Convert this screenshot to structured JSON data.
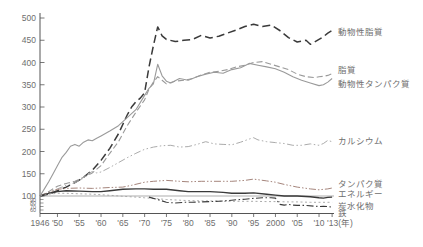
{
  "chart_data": {
    "type": "line",
    "title": "",
    "subtitle": "",
    "x_axis": {
      "unit_label": "(年)",
      "range": [
        1946,
        2015
      ],
      "tick_years": [
        1946,
        1950,
        1955,
        1960,
        1965,
        1970,
        1975,
        1980,
        1985,
        1990,
        1995,
        2000,
        2005,
        2010,
        2013
      ],
      "tick_labels": [
        "1946",
        "'50",
        "'55",
        "'60",
        "'65",
        "'70",
        "'75",
        "'80",
        "'85",
        "'90",
        "'95",
        "2000",
        "'05",
        "'10",
        "'13(年)"
      ]
    },
    "y_axis": {
      "range_main": [
        100,
        500
      ],
      "tick_values": [
        500,
        450,
        400,
        350,
        300,
        250,
        200,
        150,
        100
      ],
      "tick_labels": [
        "500",
        "450",
        "400",
        "350",
        "300",
        "250",
        "200",
        "150",
        "100"
      ],
      "sub_tick_values": [
        90,
        80,
        70,
        60
      ],
      "sub_tick_labels": [
        "90",
        "80",
        "70",
        "60"
      ],
      "baseline_value": 100,
      "grid": false
    },
    "legend_position": "right-margin-labels",
    "colors": {
      "dark": "#3a3a3a",
      "gray": "#9a9a9a",
      "light_gray": "#ababab",
      "red_gray": "#a5857c",
      "axis": "#555555",
      "label_text": "#6e6e6e"
    },
    "series": [
      {
        "key": "animal-fat",
        "name": "動物性脂質",
        "color": "#3a3a3a",
        "dash": "8,4",
        "width": 1.5,
        "label_value": 468,
        "points": [
          [
            1946,
            100
          ],
          [
            1948,
            104
          ],
          [
            1950,
            112
          ],
          [
            1952,
            120
          ],
          [
            1954,
            130
          ],
          [
            1956,
            142
          ],
          [
            1958,
            158
          ],
          [
            1960,
            180
          ],
          [
            1962,
            207
          ],
          [
            1964,
            240
          ],
          [
            1966,
            282
          ],
          [
            1967,
            300
          ],
          [
            1968,
            312
          ],
          [
            1969,
            320
          ],
          [
            1970,
            332
          ],
          [
            1971,
            390
          ],
          [
            1972,
            438
          ],
          [
            1973,
            480
          ],
          [
            1974,
            460
          ],
          [
            1975,
            452
          ],
          [
            1977,
            447
          ],
          [
            1979,
            450
          ],
          [
            1981,
            452
          ],
          [
            1983,
            461
          ],
          [
            1985,
            455
          ],
          [
            1987,
            459
          ],
          [
            1989,
            466
          ],
          [
            1991,
            473
          ],
          [
            1993,
            481
          ],
          [
            1995,
            486
          ],
          [
            1997,
            481
          ],
          [
            1999,
            484
          ],
          [
            2001,
            472
          ],
          [
            2003,
            456
          ],
          [
            2005,
            446
          ],
          [
            2007,
            450
          ],
          [
            2008,
            441
          ],
          [
            2009,
            446
          ],
          [
            2010,
            452
          ],
          [
            2011,
            458
          ],
          [
            2012,
            466
          ],
          [
            2013,
            472
          ]
        ]
      },
      {
        "key": "fat",
        "name": "脂質",
        "color": "#9a9a9a",
        "dash": "6,3",
        "width": 1.1,
        "label_value": 383,
        "points": [
          [
            1946,
            100
          ],
          [
            1948,
            110
          ],
          [
            1950,
            122
          ],
          [
            1952,
            128
          ],
          [
            1954,
            133
          ],
          [
            1956,
            142
          ],
          [
            1958,
            152
          ],
          [
            1960,
            168
          ],
          [
            1962,
            196
          ],
          [
            1964,
            222
          ],
          [
            1966,
            258
          ],
          [
            1968,
            288
          ],
          [
            1970,
            316
          ],
          [
            1971,
            340
          ],
          [
            1972,
            356
          ],
          [
            1973,
            368
          ],
          [
            1974,
            360
          ],
          [
            1975,
            352
          ],
          [
            1977,
            358
          ],
          [
            1979,
            360
          ],
          [
            1981,
            364
          ],
          [
            1983,
            372
          ],
          [
            1985,
            378
          ],
          [
            1987,
            380
          ],
          [
            1989,
            384
          ],
          [
            1991,
            390
          ],
          [
            1993,
            394
          ],
          [
            1995,
            400
          ],
          [
            1997,
            402
          ],
          [
            1999,
            396
          ],
          [
            2001,
            390
          ],
          [
            2003,
            384
          ],
          [
            2005,
            374
          ],
          [
            2007,
            368
          ],
          [
            2009,
            366
          ],
          [
            2010,
            368
          ],
          [
            2011,
            369
          ],
          [
            2012,
            371
          ],
          [
            2013,
            375
          ]
        ]
      },
      {
        "key": "animal-protein",
        "name": "動物性タンパク質",
        "color": "#9a9a9a",
        "dash": "",
        "width": 1.1,
        "label_value": 352,
        "points": [
          [
            1946,
            100
          ],
          [
            1947,
            116
          ],
          [
            1948,
            132
          ],
          [
            1949,
            150
          ],
          [
            1950,
            168
          ],
          [
            1951,
            186
          ],
          [
            1952,
            198
          ],
          [
            1953,
            212
          ],
          [
            1954,
            216
          ],
          [
            1955,
            212
          ],
          [
            1956,
            221
          ],
          [
            1957,
            226
          ],
          [
            1958,
            224
          ],
          [
            1959,
            230
          ],
          [
            1960,
            235
          ],
          [
            1962,
            246
          ],
          [
            1964,
            258
          ],
          [
            1966,
            276
          ],
          [
            1968,
            294
          ],
          [
            1970,
            326
          ],
          [
            1971,
            342
          ],
          [
            1972,
            352
          ],
          [
            1973,
            396
          ],
          [
            1974,
            370
          ],
          [
            1975,
            358
          ],
          [
            1976,
            354
          ],
          [
            1978,
            364
          ],
          [
            1980,
            360
          ],
          [
            1982,
            368
          ],
          [
            1984,
            374
          ],
          [
            1986,
            378
          ],
          [
            1988,
            376
          ],
          [
            1990,
            384
          ],
          [
            1992,
            388
          ],
          [
            1994,
            398
          ],
          [
            1996,
            394
          ],
          [
            1998,
            390
          ],
          [
            2000,
            386
          ],
          [
            2002,
            378
          ],
          [
            2004,
            368
          ],
          [
            2006,
            360
          ],
          [
            2008,
            354
          ],
          [
            2010,
            348
          ],
          [
            2011,
            350
          ],
          [
            2012,
            356
          ],
          [
            2013,
            364
          ]
        ]
      },
      {
        "key": "calcium",
        "name": "カルシウム",
        "color": "#ababab",
        "dash": "7,2.5,1.5,2.5,1.5,2.5",
        "width": 1.0,
        "label_value": 224,
        "points": [
          [
            1946,
            100
          ],
          [
            1948,
            108
          ],
          [
            1950,
            116
          ],
          [
            1952,
            124
          ],
          [
            1954,
            130
          ],
          [
            1956,
            140
          ],
          [
            1957,
            150
          ],
          [
            1958,
            155
          ],
          [
            1959,
            152
          ],
          [
            1960,
            154
          ],
          [
            1962,
            164
          ],
          [
            1964,
            175
          ],
          [
            1966,
            186
          ],
          [
            1968,
            196
          ],
          [
            1970,
            205
          ],
          [
            1972,
            210
          ],
          [
            1974,
            213
          ],
          [
            1976,
            214
          ],
          [
            1978,
            210
          ],
          [
            1980,
            211
          ],
          [
            1982,
            216
          ],
          [
            1984,
            222
          ],
          [
            1986,
            217
          ],
          [
            1988,
            216
          ],
          [
            1990,
            215
          ],
          [
            1992,
            221
          ],
          [
            1994,
            228
          ],
          [
            1995,
            231
          ],
          [
            1996,
            226
          ],
          [
            1998,
            222
          ],
          [
            2000,
            220
          ],
          [
            2002,
            218
          ],
          [
            2004,
            214
          ],
          [
            2006,
            214
          ],
          [
            2008,
            217
          ],
          [
            2010,
            214
          ],
          [
            2011,
            218
          ],
          [
            2012,
            225
          ],
          [
            2013,
            222
          ]
        ]
      },
      {
        "key": "protein",
        "name": "タンパク質",
        "color": "#a5857c",
        "dash": "7,2,1.5,2,1.5,2",
        "width": 1.0,
        "label_value": 127,
        "points": [
          [
            1946,
            100
          ],
          [
            1948,
            108
          ],
          [
            1950,
            115
          ],
          [
            1952,
            117
          ],
          [
            1955,
            118
          ],
          [
            1958,
            117
          ],
          [
            1960,
            118
          ],
          [
            1962,
            119
          ],
          [
            1965,
            120
          ],
          [
            1967,
            124
          ],
          [
            1970,
            131
          ],
          [
            1972,
            133
          ],
          [
            1975,
            135
          ],
          [
            1978,
            133
          ],
          [
            1980,
            132
          ],
          [
            1983,
            133
          ],
          [
            1985,
            133
          ],
          [
            1988,
            133
          ],
          [
            1990,
            133
          ],
          [
            1993,
            135
          ],
          [
            1995,
            138
          ],
          [
            1998,
            134
          ],
          [
            2000,
            131
          ],
          [
            2002,
            126
          ],
          [
            2005,
            120
          ],
          [
            2008,
            116
          ],
          [
            2010,
            114
          ],
          [
            2012,
            116
          ],
          [
            2013,
            118
          ]
        ]
      },
      {
        "key": "energy",
        "name": "エネルギー",
        "color": "#3a3a3a",
        "dash": "",
        "width": 1.4,
        "label_value": 104,
        "points": [
          [
            1946,
            100
          ],
          [
            1948,
            106
          ],
          [
            1950,
            110
          ],
          [
            1952,
            112
          ],
          [
            1955,
            111
          ],
          [
            1958,
            110
          ],
          [
            1960,
            110
          ],
          [
            1962,
            112
          ],
          [
            1965,
            115
          ],
          [
            1968,
            116
          ],
          [
            1970,
            116
          ],
          [
            1972,
            115
          ],
          [
            1975,
            115
          ],
          [
            1978,
            112
          ],
          [
            1980,
            110
          ],
          [
            1983,
            110
          ],
          [
            1985,
            110
          ],
          [
            1988,
            108
          ],
          [
            1990,
            106
          ],
          [
            1993,
            106
          ],
          [
            1995,
            107
          ],
          [
            1998,
            104
          ],
          [
            2000,
            102
          ],
          [
            2002,
            100
          ],
          [
            2005,
            100
          ],
          [
            2008,
            98
          ],
          [
            2010,
            95
          ],
          [
            2011,
            94
          ],
          [
            2012,
            96
          ],
          [
            2013,
            97
          ]
        ]
      },
      {
        "key": "carbohydrate",
        "name": "炭水化物",
        "color": "#ababab",
        "dash": "2,2.5",
        "width": 1.0,
        "label_value": 72,
        "points": [
          [
            1946,
            100
          ],
          [
            1948,
            104
          ],
          [
            1950,
            106
          ],
          [
            1952,
            106
          ],
          [
            1955,
            105
          ],
          [
            1958,
            104
          ],
          [
            1960,
            103
          ],
          [
            1963,
            101
          ],
          [
            1965,
            99
          ],
          [
            1968,
            97
          ],
          [
            1970,
            95
          ],
          [
            1972,
            93
          ],
          [
            1975,
            90
          ],
          [
            1978,
            88
          ],
          [
            1980,
            87
          ],
          [
            1983,
            86
          ],
          [
            1985,
            86
          ],
          [
            1988,
            85
          ],
          [
            1990,
            85
          ],
          [
            1993,
            85
          ],
          [
            1995,
            85
          ],
          [
            1998,
            84
          ],
          [
            2000,
            84
          ],
          [
            2003,
            83
          ],
          [
            2005,
            83
          ],
          [
            2008,
            82
          ],
          [
            2010,
            82
          ],
          [
            2013,
            82
          ]
        ]
      },
      {
        "key": "iron",
        "name": "鉄",
        "color": "#3a3a3a",
        "dash": "7,2.5,1.5,2.5",
        "width": 1.1,
        "label_value": 52,
        "points": [
          [
            1971,
            97
          ],
          [
            1972,
            93
          ],
          [
            1973,
            90
          ],
          [
            1975,
            82
          ],
          [
            1977,
            80
          ],
          [
            1979,
            82
          ],
          [
            1981,
            82
          ],
          [
            1983,
            83
          ],
          [
            1985,
            84
          ],
          [
            1987,
            85
          ],
          [
            1989,
            87
          ],
          [
            1991,
            89
          ],
          [
            1993,
            91
          ],
          [
            1995,
            93
          ],
          [
            1997,
            95
          ],
          [
            1999,
            95
          ],
          [
            2000,
            94
          ],
          [
            2001,
            76
          ],
          [
            2002,
            74
          ],
          [
            2003,
            76
          ],
          [
            2004,
            74
          ],
          [
            2005,
            73
          ],
          [
            2007,
            73
          ],
          [
            2009,
            71
          ],
          [
            2010,
            70
          ],
          [
            2011,
            71
          ],
          [
            2012,
            70
          ],
          [
            2013,
            68
          ]
        ]
      }
    ]
  }
}
